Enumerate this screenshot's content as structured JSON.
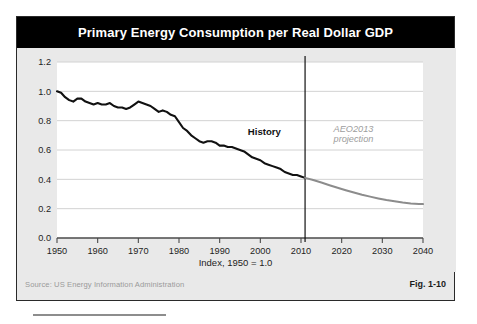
{
  "figure": {
    "title": "Primary Energy Consumption per Real Dollar GDP",
    "axis_caption": "Index, 1950 = 1.0",
    "source": "Source:  US Energy Information Administration",
    "fig_number": "Fig. 1-10",
    "colors": {
      "title_bar": "#000000",
      "title_text": "#ffffff",
      "panel_bg": "#e9e9e9",
      "plot_bg": "#ffffff",
      "history_line": "#111111",
      "projection_line": "#8c8c8c",
      "gridline": "#d2d2d2",
      "axis": "#4a4a4a",
      "divider": "#111111",
      "source_text": "#9a9a9a"
    }
  },
  "chart_data": {
    "type": "line",
    "title": "Primary Energy Consumption per Real Dollar GDP",
    "xlabel": "",
    "ylabel": "",
    "caption": "Index, 1950 = 1.0",
    "xlim": [
      1950,
      2040
    ],
    "ylim": [
      0.0,
      1.2
    ],
    "xticks": [
      1950,
      1960,
      1970,
      1980,
      1990,
      2000,
      2010,
      2020,
      2030,
      2040
    ],
    "yticks": [
      0.0,
      0.2,
      0.4,
      0.6,
      0.8,
      1.0,
      1.2
    ],
    "grid": true,
    "legend": "none",
    "annotations": [
      {
        "name": "history",
        "text": "History",
        "x": 2001,
        "y": 0.7,
        "style": "bold-dark"
      },
      {
        "name": "projection",
        "text": "AEO2013",
        "x": 2018,
        "y": 0.72,
        "style": "italic-gray"
      },
      {
        "name": "projection2",
        "text": "projection",
        "x": 2018,
        "y": 0.655,
        "style": "italic-gray"
      }
    ],
    "divider": {
      "x": 2011,
      "label": "history/projection boundary"
    },
    "series": [
      {
        "name": "History",
        "color": "#111111",
        "x": [
          1950,
          1951,
          1952,
          1953,
          1954,
          1955,
          1956,
          1957,
          1958,
          1959,
          1960,
          1961,
          1962,
          1963,
          1964,
          1965,
          1966,
          1967,
          1968,
          1969,
          1970,
          1971,
          1972,
          1973,
          1974,
          1975,
          1976,
          1977,
          1978,
          1979,
          1980,
          1981,
          1982,
          1983,
          1984,
          1985,
          1986,
          1987,
          1988,
          1989,
          1990,
          1991,
          1992,
          1993,
          1994,
          1995,
          1996,
          1997,
          1998,
          1999,
          2000,
          2001,
          2002,
          2003,
          2004,
          2005,
          2006,
          2007,
          2008,
          2009,
          2010,
          2011
        ],
        "values": [
          1.0,
          0.99,
          0.96,
          0.94,
          0.93,
          0.95,
          0.95,
          0.93,
          0.92,
          0.91,
          0.92,
          0.91,
          0.91,
          0.92,
          0.9,
          0.89,
          0.89,
          0.88,
          0.89,
          0.91,
          0.93,
          0.92,
          0.91,
          0.9,
          0.88,
          0.86,
          0.87,
          0.86,
          0.84,
          0.83,
          0.79,
          0.75,
          0.73,
          0.7,
          0.68,
          0.66,
          0.65,
          0.66,
          0.66,
          0.65,
          0.63,
          0.63,
          0.62,
          0.62,
          0.61,
          0.6,
          0.59,
          0.57,
          0.55,
          0.54,
          0.53,
          0.51,
          0.5,
          0.49,
          0.48,
          0.47,
          0.45,
          0.44,
          0.43,
          0.43,
          0.42,
          0.41
        ]
      },
      {
        "name": "AEO2013 projection",
        "color": "#8c8c8c",
        "x": [
          2011,
          2013,
          2015,
          2017,
          2019,
          2021,
          2023,
          2025,
          2027,
          2029,
          2031,
          2033,
          2035,
          2037,
          2039,
          2040
        ],
        "values": [
          0.41,
          0.395,
          0.378,
          0.36,
          0.343,
          0.326,
          0.31,
          0.295,
          0.282,
          0.27,
          0.259,
          0.25,
          0.242,
          0.236,
          0.232,
          0.231
        ]
      }
    ]
  }
}
